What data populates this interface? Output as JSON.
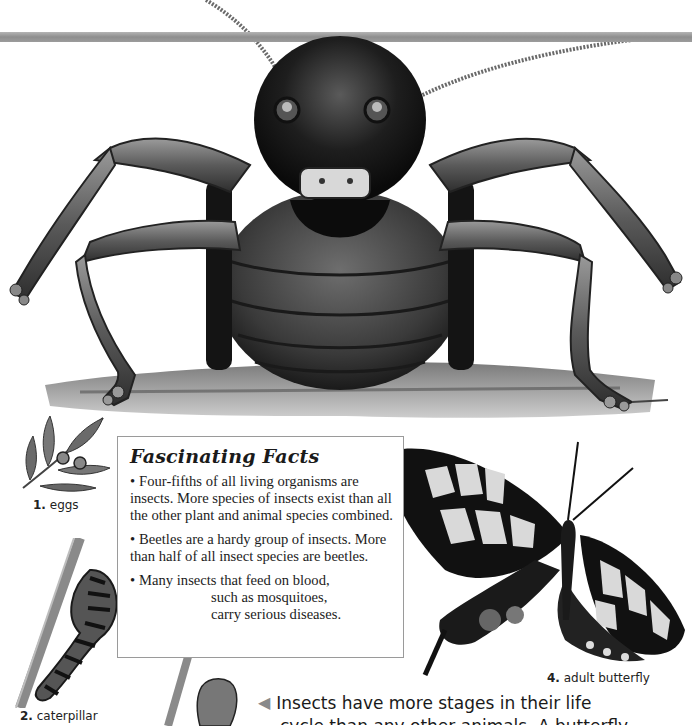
{
  "page": {
    "background": "#ffffff",
    "rule_color": "#999999"
  },
  "illustrations": {
    "main": {
      "subject": "cricket-front-view"
    },
    "stages": [
      {
        "number": "1.",
        "label": "eggs",
        "icon": "eggs-on-leaf-icon"
      },
      {
        "number": "2.",
        "label": "caterpillar",
        "icon": "caterpillar-icon"
      },
      {
        "number": "3.",
        "label": "",
        "icon": "pupa-chrysalis-icon"
      },
      {
        "number": "4.",
        "label": "adult butterfly",
        "icon": "swallowtail-butterfly-icon"
      }
    ]
  },
  "facts_box": {
    "title": "Fascinating Facts",
    "bullet": "•",
    "facts": [
      {
        "text": "Four-fifths of all living organisms are insects. More species of insects exist than all the other plant and animal species combined."
      },
      {
        "text": "Beetles are a hardy group of insects. More than half of all insect species are beetles."
      },
      {
        "line1": "Many insects that feed on blood,",
        "line2": "such as mosquitoes,",
        "line3": "carry serious diseases."
      }
    ]
  },
  "caption": {
    "arrow": "◀",
    "line1": "Insects have more stages in their life",
    "line2_partial": "cycle than any other animals. A butterfly"
  }
}
